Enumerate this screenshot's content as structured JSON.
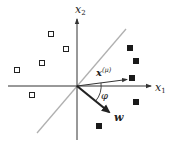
{
  "diagram": {
    "type": "perceptron-classification",
    "axes": {
      "x_label": "x",
      "x_sub": "1",
      "y_label": "x",
      "y_sub": "2"
    },
    "vectors": {
      "input": {
        "label": "x",
        "superscript": "(μ)"
      },
      "weight": {
        "label": "w"
      }
    },
    "angle_label": "φ",
    "colors": {
      "axis": "#333333",
      "boundary": "#b0b0b0",
      "vector": "#222222",
      "marker": "#1a1a1a"
    },
    "class_open_points": [
      [
        51,
        34
      ],
      [
        66,
        49
      ],
      [
        42,
        63
      ],
      [
        17,
        70
      ],
      [
        32,
        95
      ]
    ],
    "class_filled_points": [
      [
        130,
        48
      ],
      [
        136,
        61
      ],
      [
        132,
        78
      ],
      [
        136,
        102
      ],
      [
        99,
        126
      ]
    ]
  }
}
